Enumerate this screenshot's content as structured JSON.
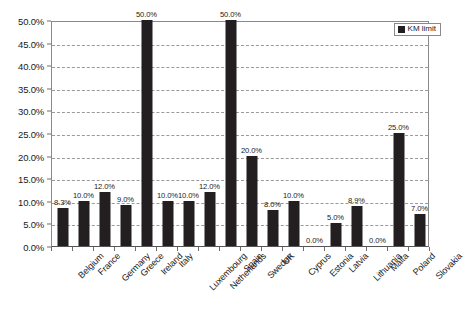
{
  "chart_data": {
    "type": "bar",
    "title": "",
    "xlabel": "",
    "ylabel": "",
    "ylim": [
      0,
      50
    ],
    "grid": true,
    "legend_position": "top-right",
    "categories": [
      "Belgium",
      "France",
      "Germany",
      "Greece",
      "Ireland",
      "Italy",
      "Luxembourg",
      "Netherlands",
      "Spain",
      "Sweden",
      "UK",
      "Cyprus",
      "Estonia",
      "Latvia",
      "Lithuania",
      "Malta",
      "Poland",
      "Slovakia"
    ],
    "values": [
      8.3,
      10.0,
      12.0,
      9.0,
      50.0,
      10.0,
      10.0,
      12.0,
      50.0,
      20.0,
      8.0,
      10.0,
      0.0,
      5.0,
      8.9,
      0.0,
      25.0,
      7.0
    ],
    "data_labels": [
      "8.3%",
      "10.0%",
      "12.0%",
      "9.0%",
      "50.0%",
      "10.0%",
      "10.0%",
      "12.0%",
      "50.0%",
      "20.0%",
      "8.0%",
      "10.0%",
      "0.0%",
      "5.0%",
      "8.9%",
      "0.0%",
      "25.0%",
      "7.0%"
    ],
    "series": [
      {
        "name": "KM limit",
        "color": "#231f20",
        "values": [
          8.3,
          10.0,
          12.0,
          9.0,
          50.0,
          10.0,
          10.0,
          12.0,
          50.0,
          20.0,
          8.0,
          10.0,
          0.0,
          5.0,
          8.9,
          0.0,
          25.0,
          7.0
        ]
      }
    ],
    "y_ticks": [
      0,
      5,
      10,
      15,
      20,
      25,
      30,
      35,
      40,
      45,
      50
    ],
    "y_tick_labels": [
      "0.0%",
      "5.0%",
      "10.0%",
      "15.0%",
      "20.0%",
      "25.0%",
      "30.0%",
      "35.0%",
      "40.0%",
      "45.0%",
      "50.0%"
    ]
  },
  "legend": {
    "entries": [
      {
        "label": "KM limit",
        "color": "#231f20"
      }
    ]
  },
  "colors": {
    "bar": "#231f20",
    "gridline": "#9a9a9a",
    "axis": "#6f6f6f",
    "text": "#1a1a1a",
    "background": "#ffffff"
  }
}
